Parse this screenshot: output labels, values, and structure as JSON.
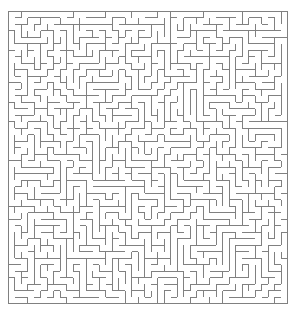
{
  "page": {
    "width": 298,
    "height": 314,
    "background_color": "#ffffff"
  },
  "maze": {
    "label": "maze-grid",
    "type": "perfect-maze",
    "algorithm": "recursive-backtracker",
    "seed": 20240517,
    "columns": 43,
    "rows": 45,
    "cell_size": 6.5,
    "origin_x": 8,
    "origin_y": 11,
    "width_px": 279.5,
    "height_px": 292.5,
    "wall_color": "#808080",
    "wall_width": 1,
    "background_color": "#ffffff",
    "border": {
      "top": "closed",
      "right": "closed",
      "bottom": "closed",
      "left": "closed"
    },
    "entrance": null,
    "exit": null
  }
}
